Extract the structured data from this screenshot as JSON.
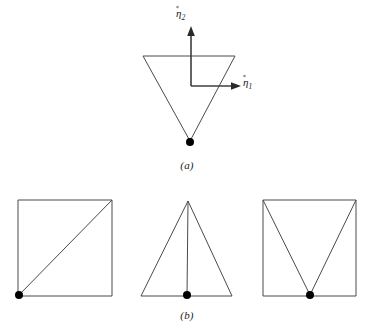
{
  "figure": {
    "background": "#ffffff",
    "line_color": "#4a4a4a",
    "dot_color": "#000000",
    "panels": [
      {
        "id": "a",
        "caption": "(a)",
        "description": "inverted-triangle-with-reference-square"
      },
      {
        "id": "b",
        "caption": "(b)",
        "description": "three-subdivided-elements"
      }
    ],
    "axes": {
      "eta1": {
        "label_base": "η",
        "label_sub": "1",
        "direction": "horizontal-right"
      },
      "eta2": {
        "label_base": "η",
        "label_sub": "2",
        "direction": "vertical-up"
      }
    },
    "panel_a": {
      "triangle": {
        "name": "inverted-triangle",
        "points": "143,56 235,56 190,141"
      },
      "reference_square": {
        "name": "reference-square-corner",
        "path": "M 191,30 L 191,86 L 239,86"
      },
      "vertex_dot": {
        "cx": 190,
        "cy": 142,
        "r": 4
      },
      "axis_vertical": {
        "x1": 191,
        "y1": 86,
        "x2": 191,
        "y2": 31
      },
      "axis_horizontal": {
        "x1": 191,
        "y1": 86,
        "x2": 236,
        "y2": 86
      },
      "arrow_up": "191,26 187.2,36 194.8,36",
      "arrow_right": "241,86 231,82.2 231,89.8"
    },
    "panel_b": {
      "elements": [
        {
          "name": "square-with-diagonal",
          "outline": "18,200 112,200 112,296 18,296",
          "internal": [
            "M 18,296 L 112,200"
          ],
          "dots": [
            {
              "cx": 19,
              "cy": 295,
              "r": 4
            }
          ]
        },
        {
          "name": "triangle-with-median",
          "outline": "188,201 232,296 141,296",
          "internal": [
            "M 188,201 L 187,296"
          ],
          "dots": [
            {
              "cx": 187,
              "cy": 295,
              "r": 4
            }
          ]
        },
        {
          "name": "square-with-v-split",
          "outline": "263,200 356,200 356,296 263,296",
          "internal": [
            "M 263,200 L 310,295",
            "M 356,200 L 310,295"
          ],
          "dots": [
            {
              "cx": 310,
              "cy": 295,
              "r": 4
            }
          ]
        }
      ]
    }
  }
}
